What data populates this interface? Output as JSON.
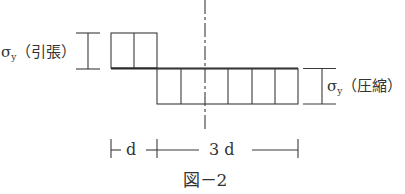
{
  "figure": {
    "caption": "図－2",
    "tension_label": {
      "symbol": "σ",
      "subscript": "y",
      "text": "（引張）"
    },
    "compression_label": {
      "symbol": "σ",
      "subscript": "y",
      "text": "（圧縮）"
    },
    "dimensions": {
      "short": "d",
      "long": "3 d"
    },
    "stress_blocks": {
      "tension": {
        "cells": 2,
        "width_units": "d",
        "magnitude": "σy"
      },
      "compression": {
        "cells": 6,
        "width_units": "3d",
        "magnitude": "σy"
      }
    },
    "line_color": "#3a3a3a"
  }
}
